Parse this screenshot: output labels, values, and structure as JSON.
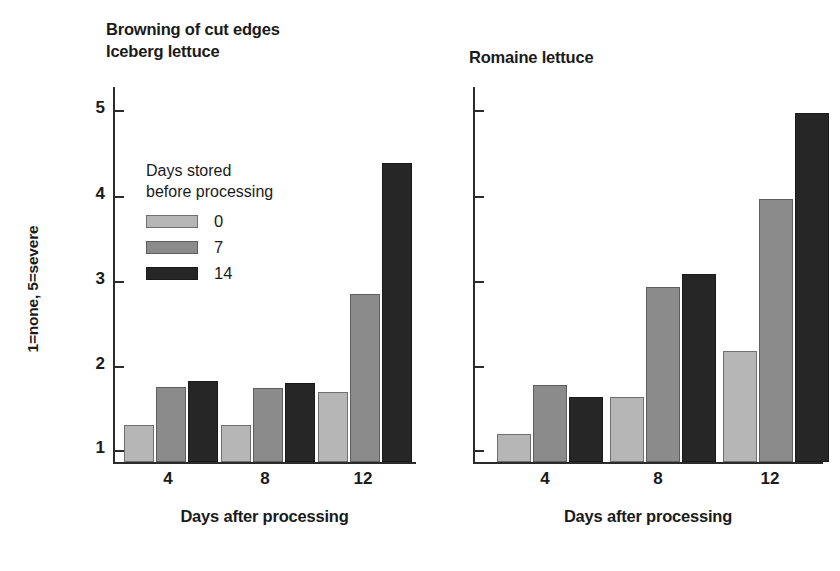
{
  "figure": {
    "background": "#ffffff",
    "ink_color": "#1b1b1b"
  },
  "ylabel": "1=none, 5=severe",
  "xlabel": "Days after processing",
  "legend": {
    "title_line1": "Days stored",
    "title_line2": "before processing",
    "entries": [
      {
        "label": "0",
        "color": "#b6b6b6"
      },
      {
        "label": "7",
        "color": "#8b8b8b"
      },
      {
        "label": "14",
        "color": "#262626"
      }
    ]
  },
  "panels": {
    "iceberg": {
      "title_line1": "Browning of cut edges",
      "title_line2": "Iceberg lettuce"
    },
    "romaine": {
      "title_line1": "Romaine lettuce"
    }
  },
  "yticks": [
    "1",
    "2",
    "3",
    "4",
    "5"
  ],
  "xticks": [
    "4",
    "8",
    "12"
  ],
  "chart_data": [
    {
      "type": "bar",
      "title": "Browning of cut edges — Iceberg lettuce",
      "xlabel": "Days after processing",
      "ylabel": "1=none, 5=severe",
      "categories": [
        "4",
        "8",
        "12"
      ],
      "ylim": [
        1,
        5
      ],
      "yticks": [
        1,
        2,
        3,
        4,
        5
      ],
      "grid": false,
      "legend_title": "Days stored before processing",
      "legend_position": "inside-upper-left",
      "series": [
        {
          "name": "0",
          "color": "#b6b6b6",
          "values": [
            1.3,
            1.3,
            1.68
          ]
        },
        {
          "name": "7",
          "color": "#8b8b8b",
          "values": [
            1.74,
            1.73,
            2.83
          ]
        },
        {
          "name": "14",
          "color": "#262626",
          "values": [
            1.81,
            1.79,
            4.38
          ]
        }
      ]
    },
    {
      "type": "bar",
      "title": "Romaine lettuce",
      "xlabel": "Days after processing",
      "ylabel": "1=none, 5=severe",
      "categories": [
        "4",
        "8",
        "12"
      ],
      "ylim": [
        1,
        5
      ],
      "yticks": [
        1,
        2,
        3,
        4,
        5
      ],
      "grid": false,
      "series": [
        {
          "name": "0",
          "color": "#b6b6b6",
          "values": [
            1.19,
            1.62,
            2.17
          ]
        },
        {
          "name": "7",
          "color": "#8b8b8b",
          "values": [
            1.77,
            2.92,
            3.95
          ]
        },
        {
          "name": "14",
          "color": "#262626",
          "values": [
            1.62,
            3.07,
            4.97
          ]
        }
      ]
    }
  ]
}
